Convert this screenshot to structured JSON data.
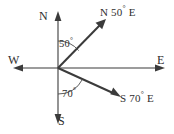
{
  "figure": {
    "type": "compass-bearing-diagram",
    "background_color": "#ffffff",
    "line_color": "#3b3b3b",
    "text_color": "#2e2e2e"
  },
  "compass": {
    "north_label": "N",
    "south_label": "S",
    "east_label": "E",
    "west_label": "W"
  },
  "bearings": [
    {
      "id": "ne",
      "label_prefix": "N",
      "label_degrees": "50",
      "label_suffix": "E",
      "label_full": "N 50° E",
      "angle_from_north_deg": 50,
      "direction": "up-right"
    },
    {
      "id": "se",
      "label_prefix": "S",
      "label_degrees": "70",
      "label_suffix": "E",
      "label_full": "S 70° E",
      "angle_from_south_deg": 70,
      "direction": "down-right"
    }
  ],
  "angle_marks": [
    {
      "id": "angle-50",
      "value": "50",
      "label_full": "50°",
      "measured_from": "N",
      "measured_to": "N 50° E ray"
    },
    {
      "id": "angle-70",
      "value": "70",
      "label_full": "70°",
      "measured_from": "S",
      "measured_to": "S 70° E ray"
    }
  ]
}
